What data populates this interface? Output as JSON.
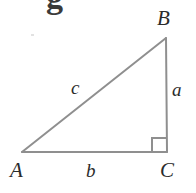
{
  "figure": {
    "type": "right-triangle-diagram",
    "background_color": "#ffffff",
    "stroke_color": "#8f8f8f",
    "label_color": "#2b2b2b",
    "clipped_heading_glyph": "g",
    "vertices": [
      {
        "id": "A",
        "label": "A",
        "x": 22,
        "y": 152
      },
      {
        "id": "B",
        "label": "B",
        "x": 166,
        "y": 38
      },
      {
        "id": "C",
        "label": "C",
        "x": 167,
        "y": 152
      }
    ],
    "sides": [
      {
        "id": "a",
        "label": "a",
        "from": "B",
        "to": "C",
        "role": "opposite-leg"
      },
      {
        "id": "b",
        "label": "b",
        "from": "A",
        "to": "C",
        "role": "adjacent-leg"
      },
      {
        "id": "c",
        "label": "c",
        "from": "A",
        "to": "B",
        "role": "hypotenuse"
      }
    ],
    "right_angle": {
      "at": "C",
      "marker": "square",
      "size": 14
    }
  }
}
